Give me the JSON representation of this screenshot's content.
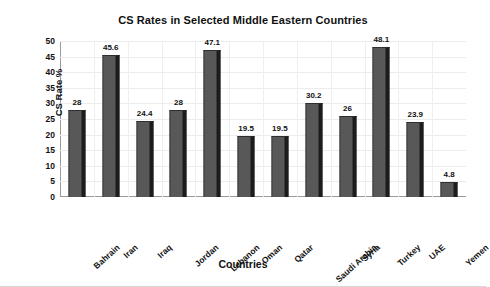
{
  "chart_data": {
    "type": "bar",
    "title": "CS Rates in Selected Middle Eastern Countries",
    "xlabel": "Countries",
    "ylabel": "CS Rate %",
    "categories": [
      "Bahrain",
      "Iran",
      "Iraq",
      "Jordan",
      "Lebanon",
      "Oman",
      "Qatar",
      "Saudi Arabia",
      "Syria",
      "Turkey",
      "UAE",
      "Yemen"
    ],
    "values": [
      28,
      45.6,
      24.4,
      28,
      47.1,
      19.5,
      19.5,
      30.2,
      26,
      48.1,
      23.9,
      4.8
    ],
    "value_labels": [
      "28",
      "45.6",
      "24.4",
      "28",
      "47.1",
      "19.5",
      "19.5",
      "30.2",
      "26",
      "48.1",
      "23.9",
      "4.8"
    ],
    "ylim": [
      0,
      50
    ],
    "yticks": [
      0,
      5,
      10,
      15,
      20,
      25,
      30,
      35,
      40,
      45,
      50
    ],
    "ytick_labels": [
      "0",
      "5",
      "10",
      "15",
      "20",
      "25",
      "30",
      "35",
      "40",
      "45",
      "50"
    ],
    "grid": true,
    "legend": false,
    "bar_color": "#585858",
    "bar_shadow_color": "#1c1c1c",
    "grid_color": "#ececec",
    "axis_color": "#9a9a9a",
    "text_color": "#111111",
    "background": "#ffffff"
  }
}
